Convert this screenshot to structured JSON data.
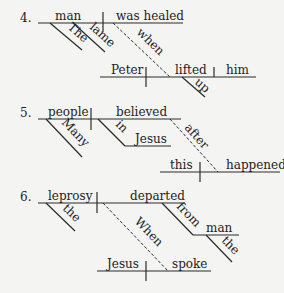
{
  "diagrams": [
    {
      "number": "4.",
      "words": {
        "subject": "man",
        "verb": "was healed",
        "mod1": "The",
        "mod2": "lame",
        "connector": "when",
        "sub_subject": "Peter",
        "sub_verb": "lifted",
        "sub_object": "him",
        "sub_mod": "up"
      }
    },
    {
      "number": "5.",
      "words": {
        "subject": "people",
        "verb": "believed",
        "mod1": "Many",
        "prep": "in",
        "prep_object": "Jesus",
        "connector": "after",
        "sub_subject": "this",
        "sub_verb": "happened"
      }
    },
    {
      "number": "6.",
      "words": {
        "subject": "leprosy",
        "verb": "departed",
        "mod1": "the",
        "connector": "When",
        "prep": "from",
        "prep_object": "man",
        "prep_mod": "the",
        "sub_subject": "Jesus",
        "sub_verb": "spoke"
      }
    }
  ],
  "colors": {
    "background": "#f4f4f2",
    "ink": "#2a2a2a"
  }
}
